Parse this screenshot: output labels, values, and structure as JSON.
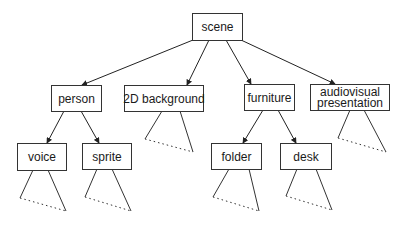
{
  "diagram": {
    "type": "tree",
    "nodes": [
      {
        "id": "scene",
        "label": [
          "scene"
        ],
        "x": 192,
        "y": 13,
        "w": 50,
        "h": 27
      },
      {
        "id": "person",
        "label": [
          "person"
        ],
        "x": 51,
        "y": 85,
        "w": 50,
        "h": 26
      },
      {
        "id": "2d-background",
        "label": [
          "2D background"
        ],
        "x": 124,
        "y": 85,
        "w": 79,
        "h": 26
      },
      {
        "id": "furniture",
        "label": [
          "furniture"
        ],
        "x": 244,
        "y": 84,
        "w": 50,
        "h": 26
      },
      {
        "id": "audiovisual-presentation",
        "label": [
          "audiovisual",
          "presentation"
        ],
        "x": 310,
        "y": 84,
        "w": 79,
        "h": 26
      },
      {
        "id": "voice",
        "label": [
          "voice"
        ],
        "x": 17,
        "y": 143,
        "w": 49,
        "h": 27
      },
      {
        "id": "sprite",
        "label": [
          "sprite"
        ],
        "x": 82,
        "y": 143,
        "w": 49,
        "h": 26
      },
      {
        "id": "folder",
        "label": [
          "folder"
        ],
        "x": 211,
        "y": 143,
        "w": 50,
        "h": 26
      },
      {
        "id": "desk",
        "label": [
          "desk"
        ],
        "x": 280,
        "y": 143,
        "w": 51,
        "h": 26
      }
    ],
    "edges": [
      {
        "from": "scene",
        "to": "person",
        "x1": 193,
        "y1": 40,
        "x2": 82,
        "y2": 85
      },
      {
        "from": "scene",
        "to": "2d-background",
        "x1": 209,
        "y1": 40,
        "x2": 187,
        "y2": 85
      },
      {
        "from": "scene",
        "to": "furniture",
        "x1": 226,
        "y1": 40,
        "x2": 251,
        "y2": 84
      },
      {
        "from": "scene",
        "to": "audiovisual-presentation",
        "x1": 241,
        "y1": 40,
        "x2": 335,
        "y2": 84
      },
      {
        "from": "person",
        "to": "voice",
        "x1": 64,
        "y1": 111,
        "x2": 47,
        "y2": 143
      },
      {
        "from": "person",
        "to": "sprite",
        "x1": 81,
        "y1": 111,
        "x2": 99,
        "y2": 143
      },
      {
        "from": "furniture",
        "to": "folder",
        "x1": 263,
        "y1": 110,
        "x2": 243,
        "y2": 143
      },
      {
        "from": "furniture",
        "to": "desk",
        "x1": 278,
        "y1": 110,
        "x2": 296,
        "y2": 143
      }
    ],
    "subtrees": [
      {
        "parent": "2d-background",
        "apex_l": [
          162,
          111
        ],
        "apex_r": [
          180,
          111
        ],
        "left": [
          145,
          139
        ],
        "right": [
          193,
          152
        ]
      },
      {
        "parent": "audiovisual-presentation",
        "apex_l": [
          350,
          110
        ],
        "apex_r": [
          364,
          110
        ],
        "left": [
          338,
          138
        ],
        "right": [
          386,
          152
        ]
      },
      {
        "parent": "voice",
        "apex_l": [
          33,
          170
        ],
        "apex_r": [
          48,
          170
        ],
        "left": [
          20,
          198
        ],
        "right": [
          66,
          211
        ]
      },
      {
        "parent": "sprite",
        "apex_l": [
          97,
          169
        ],
        "apex_r": [
          112,
          169
        ],
        "left": [
          85,
          197
        ],
        "right": [
          131,
          211
        ]
      },
      {
        "parent": "folder",
        "apex_l": [
          229,
          169
        ],
        "apex_r": [
          249,
          169
        ],
        "left": [
          213,
          197
        ],
        "right": [
          259,
          211
        ]
      },
      {
        "parent": "desk",
        "apex_l": [
          297,
          169
        ],
        "apex_r": [
          316,
          169
        ],
        "left": [
          286,
          196
        ],
        "right": [
          332,
          210
        ]
      }
    ]
  }
}
